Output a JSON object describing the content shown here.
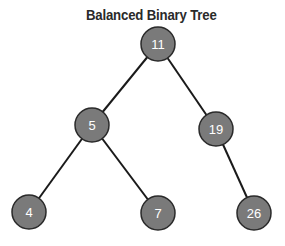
{
  "title": "Balanced Binary Tree",
  "tree": {
    "node_fill": "#7a7a7a",
    "node_stroke": "#2a2a2a",
    "edge_color": "#1a1a1a",
    "nodes": [
      {
        "id": "n11",
        "label": "11",
        "x": 158,
        "y": 44
      },
      {
        "id": "n5",
        "label": "5",
        "x": 92,
        "y": 125
      },
      {
        "id": "n19",
        "label": "19",
        "x": 216,
        "y": 129
      },
      {
        "id": "n4",
        "label": "4",
        "x": 29,
        "y": 212
      },
      {
        "id": "n7",
        "label": "7",
        "x": 158,
        "y": 213
      },
      {
        "id": "n26",
        "label": "26",
        "x": 254,
        "y": 213
      }
    ],
    "edges": [
      {
        "from": "n11",
        "to": "n5"
      },
      {
        "from": "n11",
        "to": "n19"
      },
      {
        "from": "n5",
        "to": "n4"
      },
      {
        "from": "n5",
        "to": "n7"
      },
      {
        "from": "n19",
        "to": "n26"
      }
    ]
  }
}
